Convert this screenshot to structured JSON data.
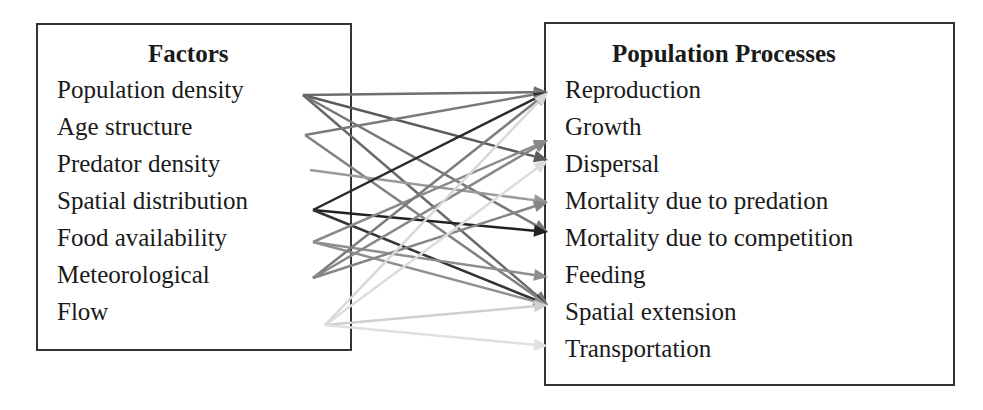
{
  "factors": {
    "title": "Factors",
    "items": [
      "Population density",
      "Age structure",
      "Predator density",
      "Spatial distribution",
      "Food availability",
      "Meteorological",
      "Flow"
    ]
  },
  "processes": {
    "title": "Population Processes",
    "items": [
      "Reproduction",
      "Growth",
      "Dispersal",
      "Mortality due to predation",
      "Mortality due to competition",
      "Feeding",
      "Spatial extension",
      "Transportation"
    ]
  },
  "links": [
    {
      "from": "Population density",
      "to": "Reproduction",
      "color": "#6e6e6e"
    },
    {
      "from": "Population density",
      "to": "Dispersal",
      "color": "#5a5a5a"
    },
    {
      "from": "Population density",
      "to": "Mortality due to competition",
      "color": "#777777"
    },
    {
      "from": "Population density",
      "to": "Spatial extension",
      "color": "#6a6a6a"
    },
    {
      "from": "Age structure",
      "to": "Reproduction",
      "color": "#7a7a7a"
    },
    {
      "from": "Age structure",
      "to": "Spatial extension",
      "color": "#808080"
    },
    {
      "from": "Predator density",
      "to": "Mortality due to predation",
      "color": "#9a9a9a"
    },
    {
      "from": "Spatial distribution",
      "to": "Reproduction",
      "color": "#2a2a2a"
    },
    {
      "from": "Spatial distribution",
      "to": "Mortality due to competition",
      "color": "#222222"
    },
    {
      "from": "Spatial distribution",
      "to": "Spatial extension",
      "color": "#333333"
    },
    {
      "from": "Food availability",
      "to": "Growth",
      "color": "#8a8a8a"
    },
    {
      "from": "Food availability",
      "to": "Feeding",
      "color": "#8e8e8e"
    },
    {
      "from": "Food availability",
      "to": "Spatial extension",
      "color": "#909090"
    },
    {
      "from": "Meteorological",
      "to": "Reproduction",
      "color": "#7c7c7c"
    },
    {
      "from": "Meteorological",
      "to": "Growth",
      "color": "#888888"
    },
    {
      "from": "Meteorological",
      "to": "Mortality due to predation",
      "color": "#858585"
    },
    {
      "from": "Flow",
      "to": "Reproduction",
      "color": "#d8d8d8"
    },
    {
      "from": "Flow",
      "to": "Dispersal",
      "color": "#dcdcdc"
    },
    {
      "from": "Flow",
      "to": "Spatial extension",
      "color": "#d0d0d0"
    },
    {
      "from": "Flow",
      "to": "Transportation",
      "color": "#e0e0e0"
    }
  ]
}
